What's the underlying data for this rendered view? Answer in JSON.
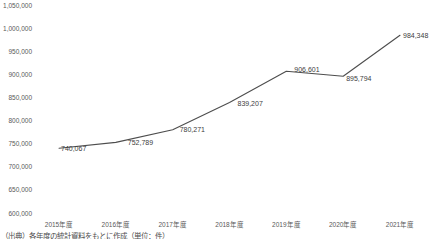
{
  "chart_data": {
    "type": "line",
    "title": "",
    "xlabel": "",
    "ylabel": "",
    "grid": false,
    "legend": false,
    "categories": [
      "2015年度",
      "2016年度",
      "2017年度",
      "2018年度",
      "2019年度",
      "2020年度",
      "2021年度"
    ],
    "series": [
      {
        "name": "値",
        "values": [
          740067,
          752789,
          780271,
          839207,
          906601,
          895794,
          984348
        ],
        "data_labels": [
          "740,067",
          "752,789",
          "780,271",
          "839,207",
          "906,601",
          "895,794",
          "984,348"
        ],
        "line_color": "#4d4d4d"
      }
    ],
    "ylim": [
      600000,
      1050000
    ],
    "y_tick_step": 50000,
    "y_tick_labels": [
      "1,050,000",
      "1,000,000",
      "950,000",
      "900,000",
      "850,000",
      "800,000",
      "750,000",
      "700,000",
      "650,000",
      "600,000"
    ]
  },
  "colors": {
    "line": "#4d4d4d",
    "tick_text": "#595959",
    "data_label_text": "#404040",
    "background": "#ffffff"
  },
  "footnote": "（出典）各年度の統計資料をもとに作成（単位：件）"
}
